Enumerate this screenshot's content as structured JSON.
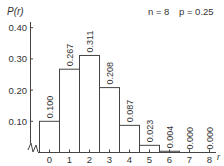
{
  "chart_data": {
    "type": "bar",
    "title": "",
    "ylabel": "P(r)",
    "xlabel": "r",
    "annotation": {
      "n_label": "n = 8",
      "p_label": "p = 0.25"
    },
    "categories": [
      "0",
      "1",
      "2",
      "3",
      "4",
      "5",
      "6",
      "7",
      "8"
    ],
    "values": [
      0.1,
      0.267,
      0.311,
      0.208,
      0.087,
      0.023,
      0.004,
      0.0,
      0.0
    ],
    "value_labels": [
      "0.100",
      "0.267",
      "0.311",
      "0.208",
      "0.087",
      "0.023",
      "0.004",
      "0.000",
      "0.000"
    ],
    "yticks": [
      "0.10",
      "0.20",
      "0.30",
      "0.40"
    ],
    "ylim": [
      0,
      0.42
    ],
    "grid": false,
    "legend": "none",
    "axis_break": true
  }
}
